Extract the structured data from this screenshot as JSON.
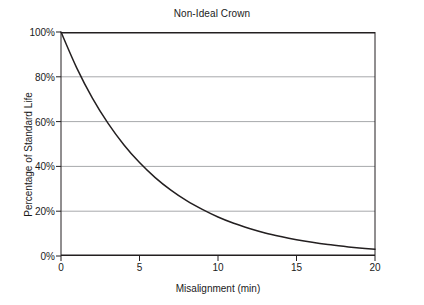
{
  "chart_data": {
    "type": "line",
    "title": "Non-Ideal Crown",
    "xlabel": "Misalignment (min)",
    "ylabel": "Percentage of Standard Life",
    "xlim": [
      0,
      20
    ],
    "ylim": [
      0,
      100
    ],
    "xticks": [
      0,
      5,
      10,
      15,
      20
    ],
    "xtick_labels": [
      "0",
      "5",
      "10",
      "15",
      "20"
    ],
    "yticks": [
      0,
      20,
      40,
      60,
      80,
      100
    ],
    "ytick_labels": [
      "0%",
      "20%",
      "40%",
      "60%",
      "80%",
      "100%"
    ],
    "grid": "horizontal",
    "legend": "none",
    "series": [
      {
        "name": "Non-Ideal Crown",
        "color": "#231f20",
        "x": [
          0,
          1,
          2,
          3,
          4,
          5,
          6,
          7,
          8,
          9,
          10,
          11,
          12,
          13,
          14,
          15,
          16,
          17,
          18,
          19,
          20
        ],
        "values": [
          100.0,
          84.0,
          70.5,
          59.2,
          49.7,
          41.7,
          35.0,
          29.4,
          24.7,
          20.8,
          17.4,
          14.6,
          12.3,
          10.3,
          8.7,
          7.3,
          6.1,
          5.1,
          4.3,
          3.6,
          3.0
        ]
      }
    ],
    "annotations": [
      {
        "description": "curve crosses 80% near x=2.2"
      },
      {
        "description": "curve crosses 60% near x=4.5"
      },
      {
        "description": "curve crosses 40% near x=7.2"
      },
      {
        "description": "curve crosses 20% near x=11.6"
      }
    ]
  },
  "colors": {
    "axis": "#231f20",
    "gridline": "#a7a9ac",
    "curve": "#231f20",
    "background": "#ffffff",
    "text": "#1a1a1a"
  }
}
